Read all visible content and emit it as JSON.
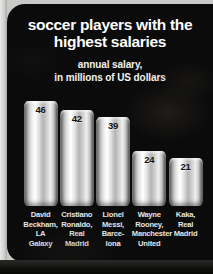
{
  "poster": {
    "title_lines": [
      "soccer players with the",
      "highest salaries"
    ],
    "subtitle_lines": [
      "annual salary,",
      "in millions of US dollars"
    ]
  },
  "colors": {
    "background": "#0b0b0b",
    "page_edge": "#c9c9c7",
    "title_text": "#ffffff",
    "bar_highlight": "#ffffff",
    "bar_shadow": "#4a4a4a",
    "value_text": "#111111",
    "label_text": "#e6e6e6"
  },
  "chart_data": {
    "type": "bar",
    "title": "soccer players with the highest salaries",
    "subtitle": "annual salary, in millions of US dollars",
    "xlabel": "",
    "ylabel": "annual salary (millions of US dollars)",
    "ylim": [
      0,
      50
    ],
    "grid": false,
    "legend": "none",
    "categories": [
      "David Beckham, LA Galaxy",
      "Cristiano Ronaldo, Real Madrid",
      "Lionel Messi, Barcelona",
      "Wayne Rooney, Manchester United",
      "Kaka, Real Madrid"
    ],
    "values": [
      46,
      42,
      39,
      24,
      21
    ],
    "value_labels": [
      "46",
      "42",
      "39",
      "24",
      "21"
    ],
    "bars": [
      {
        "value": 46,
        "value_label": "46",
        "label_lines": [
          "David",
          "Beckham,",
          "LA",
          "Galaxy"
        ]
      },
      {
        "value": 42,
        "value_label": "42",
        "label_lines": [
          "Cristiano",
          "Ronaldo,",
          "Real",
          "Madrid"
        ]
      },
      {
        "value": 39,
        "value_label": "39",
        "label_lines": [
          "Lionel",
          "Messi,",
          "Barce-",
          "lona"
        ]
      },
      {
        "value": 24,
        "value_label": "24",
        "label_lines": [
          "Wayne",
          "Rooney,",
          "Manchester",
          "United"
        ]
      },
      {
        "value": 21,
        "value_label": "21",
        "label_lines": [
          "Kaka,",
          "Real",
          "Madrid"
        ]
      }
    ]
  }
}
